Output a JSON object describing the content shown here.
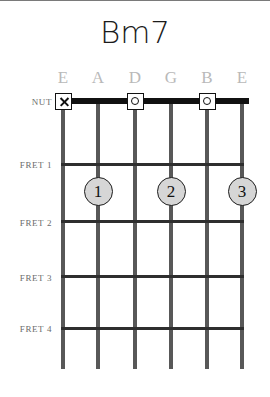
{
  "chord": {
    "name": "Bm7",
    "nut_label": "NUT",
    "fret_labels": [
      "FRET 1",
      "FRET 2",
      "FRET 3",
      "FRET 4"
    ],
    "string_names": [
      "E",
      "A",
      "D",
      "G",
      "B",
      "E"
    ],
    "nut_markers": [
      {
        "string": 1,
        "symbol": "X",
        "meaning": "muted"
      },
      {
        "string": 3,
        "symbol": "O",
        "meaning": "open"
      },
      {
        "string": 5,
        "symbol": "O",
        "meaning": "open"
      }
    ],
    "finger_positions": [
      {
        "finger": "1",
        "string": 2,
        "fret": 1
      },
      {
        "finger": "2",
        "string": 4,
        "fret": 1
      },
      {
        "finger": "3",
        "string": 6,
        "fret": 1
      }
    ],
    "colors": {
      "title": "#1b1b1b",
      "string_name": "#b9b9b9",
      "fret_label": "#6b6b6b",
      "string_line": "#585858",
      "fret_line": "#2e2e2e",
      "nut": "#111111",
      "finger_fill": "#d6d6d6"
    }
  }
}
